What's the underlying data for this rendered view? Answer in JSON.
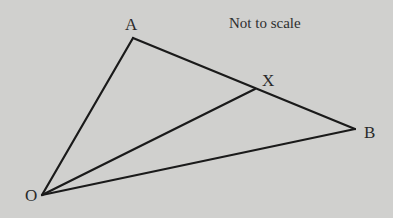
{
  "diagram": {
    "note": "Not to scale",
    "points": {
      "A": {
        "label": "A",
        "x": 133,
        "y": 38
      },
      "X": {
        "label": "X",
        "x": 255,
        "y": 89
      },
      "B": {
        "label": "B",
        "x": 355,
        "y": 129
      },
      "O": {
        "label": "O",
        "x": 42,
        "y": 195
      }
    },
    "segments": [
      {
        "from": "O",
        "to": "A"
      },
      {
        "from": "A",
        "to": "B"
      },
      {
        "from": "O",
        "to": "B"
      },
      {
        "from": "O",
        "to": "X"
      }
    ],
    "colors": {
      "background": "#d0d0ce",
      "line": "#1a1a1a",
      "text": "#2a2a2a"
    }
  }
}
